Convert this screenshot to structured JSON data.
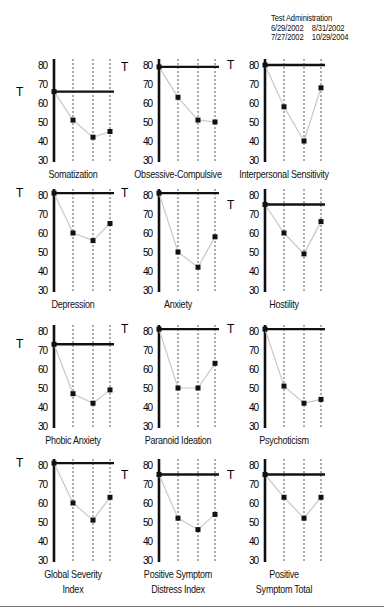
{
  "legend": {
    "title": "Test Administration",
    "dates": [
      "6/29/2002",
      "8/31/2002",
      "7/27/2002",
      "10/29/2004"
    ]
  },
  "colors": {
    "axis": "#111111",
    "line": "#c8c8c8",
    "marker": "#111111",
    "dashed": "#777777"
  },
  "chart_data": [
    {
      "type": "line",
      "title": "Somatization",
      "ylabel": "T",
      "ylim": [
        30,
        80
      ],
      "yticks": [
        30,
        40,
        50,
        60,
        70,
        80
      ],
      "x": [
        "6/29/2002",
        "7/27/2002",
        "8/31/2002",
        "10/29/2004"
      ],
      "values": [
        66,
        51,
        42,
        45
      ]
    },
    {
      "type": "line",
      "title": "Obsessive-Compulsive",
      "ylabel": "T",
      "ylim": [
        30,
        80
      ],
      "yticks": [
        30,
        40,
        50,
        60,
        70,
        80
      ],
      "x": [
        "6/29/2002",
        "7/27/2002",
        "8/31/2002",
        "10/29/2004"
      ],
      "values": [
        79,
        63,
        51,
        50
      ]
    },
    {
      "type": "line",
      "title": "Interpersonal Sensitivity",
      "ylabel": "T",
      "ylim": [
        30,
        80
      ],
      "yticks": [
        30,
        40,
        50,
        60,
        70,
        80
      ],
      "x": [
        "6/29/2002",
        "7/27/2002",
        "8/31/2002",
        "10/29/2004"
      ],
      "values": [
        80,
        58,
        40,
        68
      ]
    },
    {
      "type": "line",
      "title": "Depression",
      "ylabel": "T",
      "ylim": [
        30,
        80
      ],
      "yticks": [
        30,
        40,
        50,
        60,
        70,
        80
      ],
      "x": [
        "6/29/2002",
        "7/27/2002",
        "8/31/2002",
        "10/29/2004"
      ],
      "values": [
        81,
        60,
        56,
        65
      ]
    },
    {
      "type": "line",
      "title": "Anxiety",
      "ylabel": "T",
      "ylim": [
        30,
        80
      ],
      "yticks": [
        30,
        40,
        50,
        60,
        70,
        80
      ],
      "x": [
        "6/29/2002",
        "7/27/2002",
        "8/31/2002",
        "10/29/2004"
      ],
      "values": [
        81,
        50,
        42,
        58
      ]
    },
    {
      "type": "line",
      "title": "Hostility",
      "ylabel": "T",
      "ylim": [
        30,
        80
      ],
      "yticks": [
        30,
        40,
        50,
        60,
        70,
        80
      ],
      "x": [
        "6/29/2002",
        "7/27/2002",
        "8/31/2002",
        "10/29/2004"
      ],
      "values": [
        75,
        60,
        49,
        66
      ]
    },
    {
      "type": "line",
      "title": "Phobic Anxiety",
      "ylabel": "T",
      "ylim": [
        30,
        80
      ],
      "yticks": [
        30,
        40,
        50,
        60,
        70,
        80
      ],
      "x": [
        "6/29/2002",
        "7/27/2002",
        "8/31/2002",
        "10/29/2004"
      ],
      "values": [
        73,
        47,
        42,
        49
      ]
    },
    {
      "type": "line",
      "title": "Paranoid  Ideation",
      "ylabel": "T",
      "ylim": [
        30,
        80
      ],
      "yticks": [
        30,
        40,
        50,
        60,
        70,
        80
      ],
      "x": [
        "6/29/2002",
        "7/27/2002",
        "8/31/2002",
        "10/29/2004"
      ],
      "values": [
        81,
        50,
        50,
        63
      ]
    },
    {
      "type": "line",
      "title": "Psychoticism",
      "ylabel": "T",
      "ylim": [
        30,
        80
      ],
      "yticks": [
        30,
        40,
        50,
        60,
        70,
        80
      ],
      "x": [
        "6/29/2002",
        "7/27/2002",
        "8/31/2002",
        "10/29/2004"
      ],
      "values": [
        81,
        51,
        42,
        44
      ]
    },
    {
      "type": "line",
      "title": "Global Severity Index",
      "title_lines": [
        "Global Severity",
        "Index"
      ],
      "ylabel": "T",
      "ylim": [
        30,
        80
      ],
      "yticks": [
        30,
        40,
        50,
        60,
        70,
        80
      ],
      "x": [
        "6/29/2002",
        "7/27/2002",
        "8/31/2002",
        "10/29/2004"
      ],
      "values": [
        81,
        60,
        51,
        63
      ]
    },
    {
      "type": "line",
      "title": "Positive Symptom Distress Index",
      "title_lines": [
        "Positive Symptom",
        "Distress Index"
      ],
      "ylabel": "T",
      "ylim": [
        30,
        80
      ],
      "yticks": [
        30,
        40,
        50,
        60,
        70,
        80
      ],
      "x": [
        "6/29/2002",
        "7/27/2002",
        "8/31/2002",
        "10/29/2004"
      ],
      "values": [
        75,
        52,
        46,
        54
      ]
    },
    {
      "type": "line",
      "title": "Positive Symptom Total",
      "title_lines": [
        "Positive",
        "Symptom Total"
      ],
      "ylabel": "T",
      "ylim": [
        30,
        80
      ],
      "yticks": [
        30,
        40,
        50,
        60,
        70,
        80
      ],
      "x": [
        "6/29/2002",
        "7/27/2002",
        "8/31/2002",
        "10/29/2004"
      ],
      "values": [
        75,
        63,
        52,
        63
      ]
    }
  ]
}
